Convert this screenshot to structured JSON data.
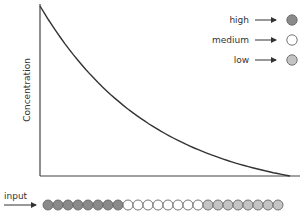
{
  "diagram": {
    "y_axis_label": "Concentration",
    "input_label": "input",
    "legend": [
      {
        "label": "high",
        "color": "#8a8a8a"
      },
      {
        "label": "medium",
        "color": "#ffffff"
      },
      {
        "label": "low",
        "color": "#c4c4c4"
      }
    ],
    "curve": "exponential-decay",
    "input_sequence": [
      "high",
      "high",
      "high",
      "high",
      "high",
      "high",
      "high",
      "high",
      "medium",
      "medium",
      "medium",
      "medium",
      "medium",
      "medium",
      "medium",
      "medium",
      "low",
      "low",
      "low",
      "low",
      "low",
      "low",
      "low",
      "low"
    ]
  }
}
